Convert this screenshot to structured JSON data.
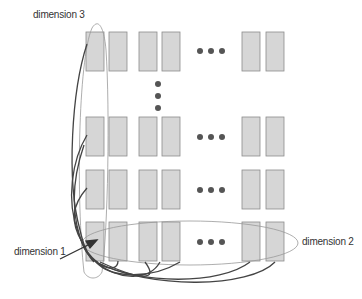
{
  "labels": {
    "dim3": "dimension 3",
    "dim2": "dimension 2",
    "dim1": "dimension 1"
  },
  "colors": {
    "box_fill": "#d6d6d6",
    "box_stroke": "#8c8c8c",
    "dot": "#555555",
    "curve": "#444444",
    "ellipse": "#999999"
  },
  "grid": {
    "columns_x": [
      86,
      109,
      139,
      162,
      242,
      266
    ],
    "rows_y": [
      32,
      117,
      170,
      222
    ],
    "box_w": 18,
    "box_h": 39
  }
}
